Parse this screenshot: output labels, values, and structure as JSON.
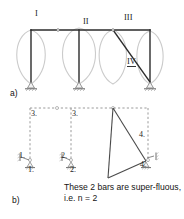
{
  "figure": {
    "colors": {
      "member": "#2b2b2b",
      "deflection_curve": "#c9c9c9",
      "dashed_frame": "#9a9a9a",
      "support": "#808080",
      "text": "#1a1a1a"
    },
    "part_a": {
      "label": "a)",
      "span_labels": [
        "I",
        "II",
        "III",
        "IV"
      ],
      "description": "Three-bay rigid frame with diagonal brace and deflected shape curves"
    },
    "part_b": {
      "label": "b)",
      "release_labels_top": [
        "3.",
        "3."
      ],
      "release_labels_left_upper": "1.",
      "release_labels_left_lower": "1.",
      "release_labels_mid_upper": "2.",
      "release_labels_mid_lower": "2.",
      "release_labels_right_upper": "4.",
      "release_labels_right_lower": "4.",
      "caption": "These 2 bars are super-fluous, i.e. n = 2"
    }
  }
}
